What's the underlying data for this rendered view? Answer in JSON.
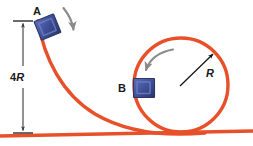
{
  "figure": {
    "background_color": "#ffffff"
  },
  "colors": {
    "track": "#e8502a",
    "track_highlight": "#f07a55",
    "block_face": "#41519a",
    "block_edge": "#2b3569",
    "block_light": "#6b7ec4",
    "motion_arrow": "#8a8a8a",
    "dimension_line": "#3a3a3a",
    "radius_arrow": "#141414",
    "label_text": "#1a1a1a"
  },
  "labels": {
    "point_a": "A",
    "point_b": "B",
    "height": "4R",
    "height_number": "4",
    "height_symbol": "R",
    "radius": "R"
  },
  "elements": {
    "ramp_name": "curved-ramp-track",
    "loop_name": "circular-loop-track",
    "ground_name": "horizontal-ground-track",
    "block_a_name": "block-at-point-a",
    "block_b_name": "block-at-point-b",
    "dimension_name": "height-dimension-line",
    "radius_name": "radius-arrow",
    "motion_arrow_a_name": "motion-arrow-at-a",
    "motion_arrow_loop_name": "motion-arrow-in-loop"
  },
  "geometry": {
    "loop_center_x": 181,
    "loop_center_y": 85,
    "loop_radius": 47,
    "height_top_y": 21,
    "height_bottom_y": 133,
    "dimension_x": 23,
    "ground_y": 133
  }
}
